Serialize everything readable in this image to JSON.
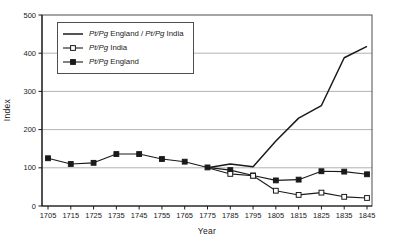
{
  "chart_data": {
    "type": "line",
    "title": "",
    "xlabel": "Year",
    "ylabel": "Index",
    "x": [
      1705,
      1715,
      1725,
      1735,
      1745,
      1755,
      1765,
      1775,
      1785,
      1795,
      1805,
      1815,
      1825,
      1835,
      1845
    ],
    "ylim": [
      0,
      500
    ],
    "yticks": [
      0,
      100,
      200,
      300,
      400,
      500
    ],
    "grid": "horizontal-only",
    "legend_position": "top-left-inside",
    "italic_token": "Pt/Pg",
    "series": [
      {
        "id": "ratio",
        "name": "Pt/Pg England / Pt/Pg India",
        "line": "solid",
        "marker": "none",
        "marker_start_index": 7,
        "values": [
          null,
          null,
          null,
          null,
          null,
          null,
          null,
          100,
          110,
          103,
          170,
          230,
          263,
          388,
          418
        ]
      },
      {
        "id": "england",
        "name": "Pt/Pg England",
        "line": "solid",
        "marker": "filled-square",
        "marker_start_index": 0,
        "values": [
          125,
          110,
          113,
          136,
          136,
          123,
          116,
          101,
          94,
          80,
          67,
          69,
          91,
          90,
          83
        ]
      },
      {
        "id": "india",
        "name": "Pt/Pg India",
        "line": "solid",
        "marker": "open-square",
        "marker_start_index": 8,
        "values": [
          null,
          null,
          null,
          null,
          null,
          null,
          null,
          100,
          84,
          79,
          40,
          29,
          35,
          24,
          21
        ]
      }
    ],
    "legend_order": [
      "ratio",
      "india",
      "england"
    ]
  },
  "colors": {
    "line": "#1a1a1a",
    "grid": "#b3b3b3",
    "frame": "#4d4d4d",
    "background": "#ffffff",
    "text": "#1a1a1a"
  }
}
